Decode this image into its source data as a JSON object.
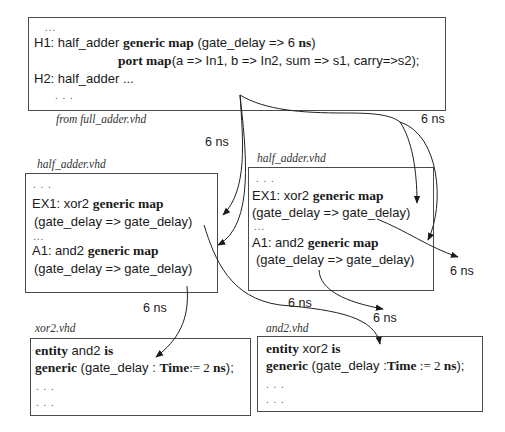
{
  "top_box": {
    "dots_top": "...",
    "line1": {
      "prefix": "H1: half_adder ",
      "kw1": "generic map",
      "mid": " (gate_delay => 6 ",
      "kw2": "ns",
      "suffix": ")"
    },
    "line2": {
      "kw": "port map",
      "rest": "(a => In1, b => In2, sum => s1, carry=>s2);"
    },
    "line3": "H2: half_adder ...",
    "dots_bottom": ". . .",
    "caption": "from full_adder.vhd"
  },
  "half_adder_left": {
    "caption": "half_adder.vhd",
    "dots_top": ". . .",
    "line1": {
      "prefix": "EX1: xor2 ",
      "kw": "generic map"
    },
    "line2": "(gate_delay => gate_delay)",
    "dots_mid": "...",
    "line3": {
      "prefix": "A1: and2 ",
      "kw": "generic map"
    },
    "line4": "(gate_delay => gate_delay)"
  },
  "half_adder_right": {
    "caption": "half_adder.vhd",
    "dots_top": ". . .",
    "line1": {
      "prefix": "EX1: xor2 ",
      "kw": "generic map"
    },
    "line2": "(gate_delay => gate_delay)",
    "dots_mid": "...",
    "line3": {
      "prefix": "A1: and2 ",
      "kw": "generic map"
    },
    "line4": "(gate_delay => gate_delay)"
  },
  "xor2_box": {
    "caption": "xor2.vhd",
    "line1": {
      "kw1": "entity",
      "mid": " and2 ",
      "kw2": "is"
    },
    "line2": {
      "kw1": "generic",
      "mid": " (gate_delay : ",
      "kw2": "Time",
      "mid2": ":= 2 ",
      "kw3": "ns",
      "suffix": ");"
    },
    "dots1": ". . .",
    "dots2": ". . ."
  },
  "and2_box": {
    "caption": "and2.vhd",
    "line1": {
      "kw1": "entity",
      "mid": " xor2 ",
      "kw2": "is"
    },
    "line2": {
      "kw1": "generic",
      "mid": " (gate_delay :",
      "kw2": "Time",
      "mid2": " := 2 ",
      "kw3": "ns",
      "suffix": ");"
    },
    "dots1": ". . .",
    "dots2": ". . ."
  },
  "delay_labels": {
    "top_right": "6 ns",
    "top_left": "6 ns",
    "right_mid": "6 ns",
    "left_bottom": "6 ns",
    "center_bottom": "6 ns",
    "right_bottom": "6 ns"
  },
  "colors": {
    "stroke": "#222222",
    "border": "#4a4a4a",
    "text": "#1a1a1a"
  }
}
